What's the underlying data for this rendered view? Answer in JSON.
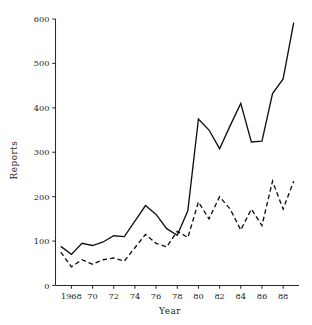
{
  "chart_data": {
    "type": "line",
    "title": "",
    "xlabel": "Year",
    "ylabel": "Reports",
    "x": [
      1967,
      1968,
      1969,
      1970,
      1971,
      1972,
      1973,
      1974,
      1975,
      1976,
      1977,
      1978,
      1979,
      1980,
      1981,
      1982,
      1983,
      1984,
      1985,
      1986,
      1987,
      1988,
      1989
    ],
    "xlim": [
      1966.5,
      1989.5
    ],
    "ylim": [
      0,
      600
    ],
    "xticks": [
      1968,
      1970,
      1972,
      1974,
      1976,
      1978,
      1980,
      1982,
      1984,
      1986,
      1988
    ],
    "xtick_labels": [
      "1968",
      "70",
      "72",
      "74",
      "76",
      "78",
      "80",
      "82",
      "84",
      "86",
      "88"
    ],
    "yticks": [
      0,
      100,
      200,
      300,
      400,
      500,
      600
    ],
    "ytick_labels": [
      "0",
      "100",
      "200",
      "300",
      "400",
      "500",
      "600"
    ],
    "grid": false,
    "legend": "none",
    "series": [
      {
        "name": "solid-series",
        "style": "solid",
        "color": "#111111",
        "x": [
          1967,
          1968,
          1969,
          1970,
          1971,
          1972,
          1973,
          1974,
          1975,
          1976,
          1977,
          1978,
          1979,
          1980,
          1981,
          1982,
          1983,
          1984,
          1985,
          1986,
          1987,
          1988,
          1989
        ],
        "values": [
          88,
          70,
          95,
          90,
          98,
          112,
          110,
          145,
          180,
          160,
          128,
          113,
          168,
          375,
          350,
          308,
          360,
          410,
          323,
          325,
          432,
          465,
          592
        ]
      },
      {
        "name": "dashed-series",
        "style": "dashed",
        "color": "#111111",
        "x": [
          1967,
          1968,
          1969,
          1970,
          1971,
          1972,
          1973,
          1974,
          1975,
          1976,
          1977,
          1978,
          1979,
          1980,
          1981,
          1982,
          1983,
          1984,
          1985,
          1986,
          1987,
          1988,
          1989
        ],
        "values": [
          75,
          42,
          58,
          48,
          58,
          62,
          55,
          85,
          115,
          95,
          87,
          122,
          108,
          188,
          150,
          200,
          172,
          125,
          172,
          135,
          235,
          172,
          235
        ]
      }
    ]
  },
  "axes": {
    "y_title": "Reports",
    "x_title": "Year"
  }
}
